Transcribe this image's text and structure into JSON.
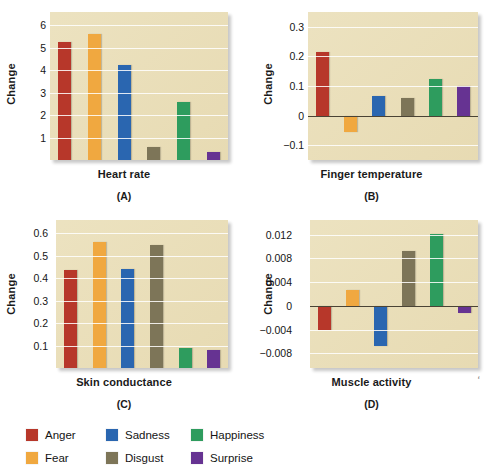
{
  "chart_data": [
    {
      "type": "bar",
      "panel": "A",
      "title": "Heart rate",
      "xlabel": "Heart rate",
      "ylabel": "Change",
      "categories": [
        "Anger",
        "Fear",
        "Sadness",
        "Disgust",
        "Happiness",
        "Surprise"
      ],
      "values": [
        5.25,
        5.6,
        4.25,
        0.6,
        2.6,
        0.35
      ],
      "ticks": [
        6,
        5,
        4,
        3,
        2,
        1
      ],
      "ylim": [
        0,
        6.6
      ],
      "grid": true,
      "legend_position": "bottom"
    },
    {
      "type": "bar",
      "panel": "B",
      "title": "Finger temperature",
      "xlabel": "Finger temperature",
      "ylabel": "Change",
      "categories": [
        "Anger",
        "Fear",
        "Sadness",
        "Disgust",
        "Happiness",
        "Surprise"
      ],
      "values": [
        0.215,
        -0.055,
        0.065,
        0.06,
        0.125,
        0.1
      ],
      "ticks": [
        0.3,
        0.2,
        0.1,
        0,
        -0.1
      ],
      "ylim": [
        -0.15,
        0.35
      ],
      "grid": true,
      "legend_position": "bottom"
    },
    {
      "type": "bar",
      "panel": "C",
      "title": "Skin conductance",
      "xlabel": "Skin conductance",
      "ylabel": "Change",
      "categories": [
        "Anger",
        "Fear",
        "Sadness",
        "Disgust",
        "Happiness",
        "Surprise"
      ],
      "values": [
        0.435,
        0.56,
        0.44,
        0.55,
        0.09,
        0.08
      ],
      "ticks": [
        0.6,
        0.5,
        0.4,
        0.3,
        0.2,
        0.1
      ],
      "ylim": [
        0,
        0.66
      ],
      "grid": true,
      "legend_position": "bottom"
    },
    {
      "type": "bar",
      "panel": "D",
      "title": "Muscle activity",
      "xlabel": "Muscle activity",
      "ylabel": "Change",
      "categories": [
        "Anger",
        "Fear",
        "Sadness",
        "Disgust",
        "Happiness",
        "Surprise"
      ],
      "values": [
        -0.0041,
        0.0027,
        -0.0068,
        0.0093,
        0.0122,
        -0.0012
      ],
      "ticks": [
        0.012,
        0.008,
        0.004,
        0,
        -0.004,
        -0.008
      ],
      "ylim": [
        -0.0105,
        0.0145
      ],
      "grid": true,
      "legend_position": "bottom"
    }
  ],
  "panels": {
    "a": {
      "ylabel": "Change",
      "xtitle": "Heart rate",
      "label": "(A)",
      "ticks": [
        "6",
        "5",
        "4",
        "3",
        "2",
        "1"
      ]
    },
    "b": {
      "ylabel": "Change",
      "xtitle": "Finger temperature",
      "label": "(B)",
      "ticks": [
        "0.3",
        "0.2",
        "0.1",
        "0",
        "−0.1"
      ]
    },
    "c": {
      "ylabel": "Change",
      "xtitle": "Skin conductance",
      "label": "(C)",
      "ticks": [
        "0.6",
        "0.5",
        "0.4",
        "0.3",
        "0.2",
        "0.1"
      ]
    },
    "d": {
      "ylabel": "Change",
      "xtitle": "Muscle activity",
      "label": "(D)",
      "ticks": [
        "0.012",
        "0.008",
        "0.004",
        "0",
        "−0.004",
        "−0.008"
      ]
    }
  },
  "legend": {
    "items": [
      {
        "label": "Anger",
        "color": "#b7372a"
      },
      {
        "label": "Sadness",
        "color": "#2a66b0"
      },
      {
        "label": "Happiness",
        "color": "#2e9c5e"
      },
      {
        "label": "Fear",
        "color": "#f0a840"
      },
      {
        "label": "Disgust",
        "color": "#7d7558"
      },
      {
        "label": "Surprise",
        "color": "#663392"
      }
    ]
  },
  "colors": {
    "anger": "#b7372a",
    "fear": "#f0a840",
    "sadness": "#2a66b0",
    "disgust": "#7d7558",
    "happiness": "#2e9c5e",
    "surprise": "#663392",
    "plot_background": "#eadfb9",
    "gridline": "#ffffff",
    "zeroline": "#4a4335"
  },
  "stray_mark": "ʻ"
}
